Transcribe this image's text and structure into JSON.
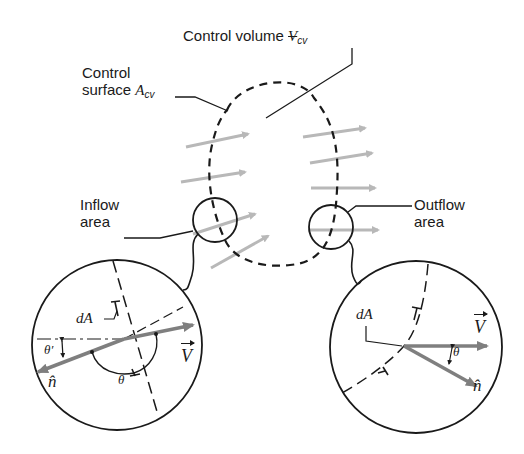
{
  "diagram": {
    "labels": {
      "control_volume": {
        "text": "Control volume ",
        "symbol": "V",
        "subscript": "cv"
      },
      "control_surface": {
        "line1": "Control",
        "line2": "surface ",
        "symbol": "A",
        "subscript": "cv"
      },
      "inflow_area": {
        "line1": "Inflow",
        "line2": "area"
      },
      "outflow_area": {
        "line1": "Outflow",
        "line2": "area"
      }
    },
    "inflow_detail": {
      "dA": "dA",
      "theta": "θ",
      "theta_prime": "θ′",
      "n_hat": "n̂",
      "V": "V"
    },
    "outflow_detail": {
      "dA": "dA",
      "theta": "θ",
      "n_hat": "n̂",
      "V": "V"
    },
    "colors": {
      "line": "#1a1a1a",
      "flow_arrow": "#b8b8b8",
      "vector_arrow": "#7f7f7f",
      "background": "#ffffff"
    }
  }
}
